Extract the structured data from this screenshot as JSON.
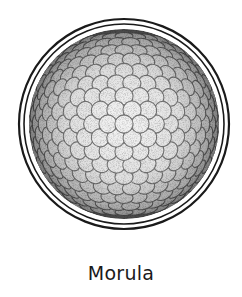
{
  "figure": {
    "title": "Morula",
    "colors": {
      "background": "#ffffff",
      "line": "#1a1a1a",
      "cell_light": "#f2f2f2",
      "cell_edge": "#3a3a3a",
      "rim_dark": "#4a4a4a"
    },
    "geometry": {
      "center_x": 124,
      "center_y": 124,
      "zona_outer_radius": 105,
      "zona_inner_radius": 100,
      "cell_ball_radius": 95
    }
  },
  "caption": {
    "label": "Morula"
  }
}
